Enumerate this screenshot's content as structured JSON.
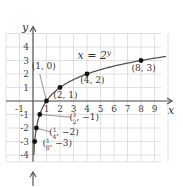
{
  "chart_data": {
    "type": "line",
    "title": "",
    "xlabel": "x",
    "ylabel": "y",
    "xlim": [
      -2,
      10
    ],
    "ylim": [
      -5,
      5
    ],
    "grid": true,
    "x_ticks": [
      "-1",
      "1",
      "2",
      "3",
      "4",
      "5",
      "6",
      "7",
      "8",
      "9"
    ],
    "x_tick_values": [
      -1,
      1,
      2,
      3,
      4,
      5,
      6,
      7,
      8,
      9
    ],
    "y_ticks": [
      "4",
      "3",
      "2",
      "1",
      "-1",
      "-2",
      "-3",
      "-4"
    ],
    "y_tick_values": [
      4,
      3,
      2,
      1,
      -1,
      -2,
      -3,
      -4
    ],
    "series": [
      {
        "name": "x = 2^y",
        "function": "x = 2^y",
        "y_range": [
          -4,
          3.3
        ]
      }
    ],
    "curve_label": {
      "text": "x = 2",
      "superscript": "y"
    },
    "points": [
      {
        "x": 0.125,
        "y": -3,
        "label": "(1/8, -3)",
        "label_num": "1",
        "label_den": "8",
        "label_rest": ", −3)"
      },
      {
        "x": 0.25,
        "y": -2,
        "label": "(1/4, -2)",
        "label_num": "1",
        "label_den": "4",
        "label_rest": ", −2)"
      },
      {
        "x": 0.5,
        "y": -1,
        "label": "(1/2, -1)",
        "label_num": "1",
        "label_den": "2",
        "label_rest": ", −1)"
      },
      {
        "x": 1,
        "y": 0,
        "label": "(1, 0)"
      },
      {
        "x": 2,
        "y": 1,
        "label": "(2, 1)"
      },
      {
        "x": 4,
        "y": 2,
        "label": "(4, 2)"
      },
      {
        "x": 8,
        "y": 3,
        "label": "(8, 3)"
      }
    ]
  }
}
